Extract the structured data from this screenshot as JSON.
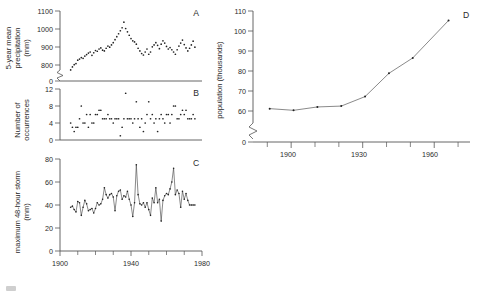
{
  "figure": {
    "background_color": "#ffffff",
    "ink_color": "#2b2b2b",
    "axis_color": "#555555",
    "marker_color": "#222222"
  },
  "panels": {
    "a": {
      "letter": "A",
      "ylabel_line1": "5-year mean",
      "ylabel_line2": "precipitation",
      "ylabel_line3": "(mm)",
      "yticks": [
        "1100",
        "1000",
        "900",
        "800",
        "0"
      ],
      "axis_break": true
    },
    "b": {
      "letter": "B",
      "ylabel_line1": "Number of",
      "ylabel_line2": "occurrences",
      "yticks": [
        "12",
        "8",
        "4",
        "0"
      ],
      "axis_break": false
    },
    "c": {
      "letter": "C",
      "ylabel_line1": "maximum 48-hour storm",
      "ylabel_line2": "(mm)",
      "yticks": [
        "80",
        "60",
        "40",
        "20",
        "0"
      ],
      "xticks": [
        "1900",
        "1940",
        "1980"
      ],
      "axis_break": false
    },
    "d": {
      "letter": "D",
      "ylabel_line1": "population (thousands)",
      "yticks": [
        "110",
        "100",
        "90",
        "80",
        "70",
        "60",
        "0"
      ],
      "xticks": [
        "1900",
        "1930",
        "1960"
      ],
      "axis_break": true
    }
  },
  "chart_data": [
    {
      "type": "scatter",
      "panel": "A",
      "title": "",
      "xlabel": "",
      "ylabel": "5-year mean precipitation (mm)",
      "xlim": [
        1900,
        1980
      ],
      "ylim": [
        770,
        1100
      ],
      "ybreak": [
        0,
        770
      ],
      "yticks": [
        800,
        900,
        1000,
        1100
      ],
      "grid": false,
      "x": [
        1906,
        1907,
        1908,
        1909,
        1910,
        1911,
        1912,
        1913,
        1914,
        1915,
        1916,
        1917,
        1918,
        1919,
        1920,
        1921,
        1922,
        1923,
        1924,
        1925,
        1926,
        1927,
        1928,
        1929,
        1930,
        1931,
        1932,
        1933,
        1934,
        1935,
        1936,
        1937,
        1938,
        1939,
        1940,
        1941,
        1942,
        1943,
        1944,
        1945,
        1946,
        1947,
        1948,
        1949,
        1950,
        1951,
        1952,
        1953,
        1954,
        1955,
        1956,
        1957,
        1958,
        1959,
        1960,
        1961,
        1962,
        1963,
        1964,
        1965,
        1966,
        1967,
        1968,
        1969,
        1970,
        1971,
        1972,
        1973,
        1974,
        1975,
        1976
      ],
      "y": [
        784,
        800,
        812,
        818,
        836,
        842,
        850,
        846,
        858,
        866,
        874,
        880,
        862,
        876,
        888,
        884,
        896,
        902,
        890,
        886,
        900,
        912,
        906,
        918,
        930,
        946,
        962,
        978,
        994,
        1010,
        1040,
        1006,
        988,
        970,
        952,
        940,
        934,
        922,
        900,
        886,
        872,
        864,
        880,
        896,
        868,
        880,
        908,
        918,
        930,
        916,
        898,
        922,
        940,
        928,
        910,
        896,
        904,
        892,
        880,
        868,
        892,
        912,
        928,
        944,
        920,
        902,
        886,
        900,
        918,
        938,
        906
      ]
    },
    {
      "type": "scatter",
      "panel": "B",
      "title": "",
      "xlabel": "",
      "ylabel": "Number of occurrences",
      "xlim": [
        1900,
        1980
      ],
      "ylim": [
        0,
        12
      ],
      "yticks": [
        0,
        4,
        8,
        12
      ],
      "grid": false,
      "x": [
        1906,
        1907,
        1908,
        1909,
        1910,
        1911,
        1912,
        1913,
        1914,
        1915,
        1916,
        1917,
        1918,
        1919,
        1920,
        1921,
        1922,
        1923,
        1924,
        1925,
        1926,
        1927,
        1928,
        1929,
        1930,
        1931,
        1932,
        1933,
        1934,
        1935,
        1936,
        1937,
        1938,
        1939,
        1940,
        1941,
        1942,
        1943,
        1944,
        1945,
        1946,
        1947,
        1948,
        1949,
        1950,
        1951,
        1952,
        1953,
        1954,
        1955,
        1956,
        1957,
        1958,
        1959,
        1960,
        1961,
        1962,
        1963,
        1964,
        1965,
        1966,
        1967,
        1968,
        1969,
        1970,
        1971,
        1972,
        1973,
        1974,
        1975,
        1976
      ],
      "y": [
        4,
        3,
        2,
        3,
        3,
        5,
        8,
        4,
        4,
        6,
        3,
        6,
        4,
        4,
        6,
        6,
        7,
        7,
        5,
        5,
        5,
        6,
        5,
        5,
        4,
        5,
        5,
        5,
        1,
        3,
        5,
        11,
        5,
        5,
        5,
        4,
        5,
        9,
        5,
        3,
        5,
        2,
        4,
        6,
        9,
        5,
        6,
        4,
        5,
        2,
        5,
        6,
        5,
        4,
        6,
        6,
        4,
        6,
        8,
        8,
        5,
        5,
        6,
        7,
        6,
        7,
        5,
        5,
        5,
        6,
        5
      ]
    },
    {
      "type": "line",
      "panel": "C",
      "title": "",
      "xlabel": "",
      "ylabel": "maximum 48-hour storm (mm)",
      "xlim": [
        1900,
        1980
      ],
      "ylim": [
        0,
        80
      ],
      "yticks": [
        0,
        20,
        40,
        60,
        80
      ],
      "xticks": [
        1900,
        1940,
        1980
      ],
      "grid": false,
      "markers": true,
      "x": [
        1906,
        1907,
        1908,
        1909,
        1910,
        1911,
        1912,
        1913,
        1914,
        1915,
        1916,
        1917,
        1918,
        1919,
        1920,
        1921,
        1922,
        1923,
        1924,
        1925,
        1926,
        1927,
        1928,
        1929,
        1930,
        1931,
        1932,
        1933,
        1934,
        1935,
        1936,
        1937,
        1938,
        1939,
        1940,
        1941,
        1942,
        1943,
        1944,
        1945,
        1946,
        1947,
        1948,
        1949,
        1950,
        1951,
        1952,
        1953,
        1954,
        1955,
        1956,
        1957,
        1958,
        1959,
        1960,
        1961,
        1962,
        1963,
        1964,
        1965,
        1966,
        1967,
        1968,
        1969,
        1970,
        1971,
        1972,
        1973,
        1974,
        1975,
        1976
      ],
      "y": [
        38,
        39,
        36,
        34,
        43,
        42,
        31,
        38,
        44,
        41,
        35,
        36,
        37,
        33,
        37,
        42,
        40,
        41,
        45,
        55,
        49,
        46,
        49,
        50,
        47,
        35,
        48,
        52,
        53,
        45,
        48,
        47,
        52,
        45,
        40,
        30,
        42,
        75,
        49,
        41,
        40,
        42,
        38,
        42,
        36,
        31,
        46,
        42,
        55,
        42,
        45,
        26,
        44,
        48,
        50,
        49,
        54,
        60,
        72,
        49,
        53,
        50,
        38,
        52,
        45,
        50,
        44,
        40,
        40,
        40,
        40
      ]
    },
    {
      "type": "line",
      "panel": "D",
      "title": "",
      "xlabel": "",
      "ylabel": "population (thousands)",
      "xlim": [
        1884,
        1975
      ],
      "ylim": [
        57,
        110
      ],
      "ybreak": [
        0,
        57
      ],
      "yticks": [
        60,
        70,
        80,
        90,
        100,
        110
      ],
      "xticks": [
        1900,
        1930,
        1960
      ],
      "minor_xticks": [
        1890,
        1910,
        1920,
        1940,
        1950,
        1970
      ],
      "grid": false,
      "markers": true,
      "x": [
        1891,
        1901,
        1911,
        1921,
        1931,
        1941,
        1951,
        1961,
        1971
      ],
      "y": [
        63.8,
        63.0,
        64.6,
        65.0,
        69.5,
        80.5,
        87.8,
        105.5,
        105.5
      ],
      "x_points": [
        1891,
        1901,
        1911,
        1921,
        1931,
        1941,
        1951,
        1966
      ],
      "y_points": [
        63.8,
        63.0,
        64.6,
        65.0,
        69.5,
        80.5,
        87.8,
        105.5
      ]
    }
  ]
}
